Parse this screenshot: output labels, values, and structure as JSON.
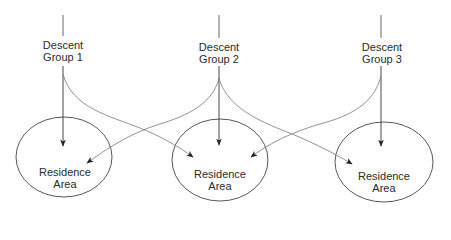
{
  "diagram": {
    "type": "flow",
    "colors": {
      "background": "#ffffff",
      "stroke": "#333333",
      "curve_stroke": "#777777",
      "text": "#2a2a2a"
    },
    "descent_groups": [
      {
        "id": "g1",
        "line1": "Descent",
        "line2": "Group 1",
        "x": 63
      },
      {
        "id": "g2",
        "line1": "Descent",
        "line2": "Group 2",
        "x": 219
      },
      {
        "id": "g3",
        "line1": "Descent",
        "line2": "Group 3",
        "x": 381
      }
    ],
    "residence_areas": [
      {
        "id": "r1",
        "line1": "Residence",
        "line2": "Area",
        "cx": 64,
        "cy": 157
      },
      {
        "id": "r2",
        "line1": "Residence",
        "line2": "Area",
        "cx": 220,
        "cy": 160
      },
      {
        "id": "r3",
        "line1": "Residence",
        "line2": "Area",
        "cx": 384,
        "cy": 162
      }
    ],
    "edges": [
      {
        "from": "g1",
        "to": "r1",
        "kind": "direct"
      },
      {
        "from": "g2",
        "to": "r2",
        "kind": "direct"
      },
      {
        "from": "g3",
        "to": "r3",
        "kind": "direct"
      },
      {
        "from": "g1",
        "to": "r2",
        "kind": "curved"
      },
      {
        "from": "g2",
        "to": "r1",
        "kind": "curved"
      },
      {
        "from": "g2",
        "to": "r3",
        "kind": "curved"
      },
      {
        "from": "g3",
        "to": "r2",
        "kind": "curved"
      }
    ]
  }
}
